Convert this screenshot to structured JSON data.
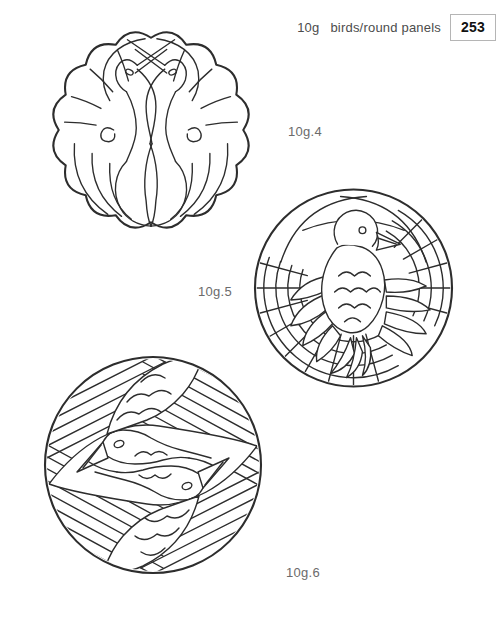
{
  "header": {
    "section": "10g",
    "title": "birds/round panels",
    "page_number": "253"
  },
  "figures": [
    {
      "label": "10g.4",
      "alt": "crest of two cranes with crossed beaks and scalloped feather border"
    },
    {
      "label": "10g.5",
      "alt": "round panel with dove, scalloped breast feathers and radiating bands"
    },
    {
      "label": "10g.6",
      "alt": "round panel with two birds in rotational symmetry, striped bands and scale feathers"
    }
  ],
  "colors": {
    "page_background": "#ffffff",
    "line": "#2d2d2d",
    "label_text": "#6b6b6b",
    "header_text": "#4c4c4c",
    "page_number_text": "#111111",
    "page_box_border": "#b5b5b5"
  }
}
